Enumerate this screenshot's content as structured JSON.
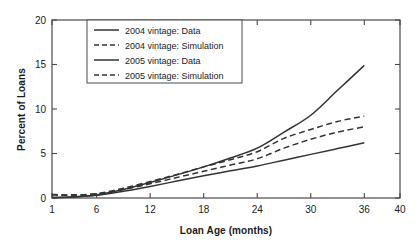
{
  "chart_data": {
    "type": "line",
    "title": "",
    "xlabel": "Loan Age (months)",
    "ylabel": "Percent of Loans",
    "xlim": [
      1,
      40
    ],
    "ylim": [
      0,
      20
    ],
    "xticks": [
      1,
      6,
      12,
      18,
      24,
      30,
      36,
      40
    ],
    "xticklabels": [
      "1",
      "6",
      "12",
      "18",
      "24",
      "30",
      "36",
      "40"
    ],
    "yticks": [
      0,
      5,
      10,
      15,
      20
    ],
    "yticklabels": [
      "0",
      "5",
      "10",
      "15",
      "20"
    ],
    "grid": false,
    "legend_position": "upper-left-inside",
    "x": [
      1,
      3,
      6,
      9,
      12,
      15,
      18,
      21,
      24,
      27,
      30,
      33,
      36
    ],
    "series": [
      {
        "name": "2004 vintage: Data",
        "style": "solid",
        "color": "#333333",
        "values": [
          0.05,
          0.1,
          0.35,
          0.95,
          1.75,
          2.6,
          3.5,
          4.5,
          5.6,
          7.4,
          9.3,
          12.1,
          14.9
        ]
      },
      {
        "name": "2004 vintage: Simulation",
        "style": "dashed",
        "color": "#333333",
        "values": [
          0.4,
          0.35,
          0.5,
          1.1,
          1.85,
          2.65,
          3.5,
          4.3,
          5.2,
          6.7,
          7.7,
          8.6,
          9.2
        ]
      },
      {
        "name": "2005 vintage: Data",
        "style": "solid",
        "color": "#333333",
        "values": [
          0.05,
          0.1,
          0.3,
          0.75,
          1.3,
          1.9,
          2.5,
          3.05,
          3.6,
          4.25,
          4.9,
          5.55,
          6.2
        ]
      },
      {
        "name": "2005 vintage: Simulation",
        "style": "dashed",
        "color": "#333333",
        "values": [
          0.35,
          0.3,
          0.45,
          0.95,
          1.6,
          2.3,
          3.0,
          3.7,
          4.4,
          5.6,
          6.6,
          7.4,
          8.0
        ]
      }
    ]
  },
  "legend": {
    "entries": [
      {
        "label": "2004 vintage: Data",
        "style": "solid"
      },
      {
        "label": "2004 vintage: Simulation",
        "style": "dashed"
      },
      {
        "label": "2005 vintage: Data",
        "style": "solid"
      },
      {
        "label": "2005 vintage: Simulation",
        "style": "dashed"
      }
    ]
  }
}
